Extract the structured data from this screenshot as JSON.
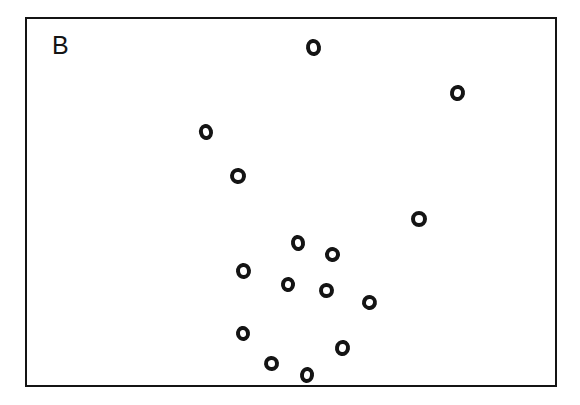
{
  "figure": {
    "panel_label": "B",
    "label_position": {
      "x": 52,
      "y": 33
    },
    "label_font_size": 25,
    "background_color": "#ffffff",
    "ink_color": "#141414"
  },
  "frame": {
    "x": 25,
    "y": 17,
    "width": 532,
    "height": 370,
    "border_width": 2,
    "border_color": "#141414",
    "fill_color": "#ffffff"
  },
  "chart_data": {
    "type": "scatter",
    "title": "B",
    "xlabel": "",
    "ylabel": "",
    "grid": false,
    "legend": null,
    "axis_ticks": false,
    "marker": {
      "shape": "open-circle",
      "fill": "#ffffff",
      "stroke": "#141414",
      "stroke_width": 4,
      "diameter": 15,
      "style": "hand-drawn"
    },
    "xlim": [
      25,
      557
    ],
    "ylim": [
      17,
      387
    ],
    "n_points": 15,
    "point_units": "pixels",
    "points": [
      {
        "id": 1,
        "x": 313,
        "y": 47,
        "w": 15,
        "h": 17,
        "rot": -8
      },
      {
        "id": 2,
        "x": 457,
        "y": 93,
        "w": 15,
        "h": 16,
        "rot": 10
      },
      {
        "id": 3,
        "x": 206,
        "y": 132,
        "w": 14,
        "h": 16,
        "rot": -14
      },
      {
        "id": 4,
        "x": 238,
        "y": 176,
        "w": 16,
        "h": 16,
        "rot": 6
      },
      {
        "id": 5,
        "x": 419,
        "y": 219,
        "w": 16,
        "h": 16,
        "rot": 0
      },
      {
        "id": 6,
        "x": 298,
        "y": 243,
        "w": 14,
        "h": 16,
        "rot": -10
      },
      {
        "id": 7,
        "x": 332,
        "y": 254,
        "w": 15,
        "h": 15,
        "rot": 12
      },
      {
        "id": 8,
        "x": 243,
        "y": 271,
        "w": 15,
        "h": 16,
        "rot": -6
      },
      {
        "id": 9,
        "x": 288,
        "y": 284,
        "w": 14,
        "h": 15,
        "rot": 8
      },
      {
        "id": 10,
        "x": 326,
        "y": 290,
        "w": 15,
        "h": 15,
        "rot": -4
      },
      {
        "id": 11,
        "x": 369,
        "y": 302,
        "w": 15,
        "h": 15,
        "rot": 14
      },
      {
        "id": 12,
        "x": 243,
        "y": 333,
        "w": 14,
        "h": 15,
        "rot": -10
      },
      {
        "id": 13,
        "x": 342,
        "y": 348,
        "w": 15,
        "h": 16,
        "rot": 10
      },
      {
        "id": 14,
        "x": 271,
        "y": 363,
        "w": 15,
        "h": 15,
        "rot": -6
      },
      {
        "id": 15,
        "x": 307,
        "y": 375,
        "w": 14,
        "h": 16,
        "rot": 8
      }
    ]
  }
}
